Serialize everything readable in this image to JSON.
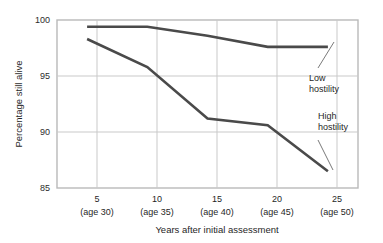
{
  "chart_data": {
    "type": "line",
    "title": "",
    "xlabel": "Years after initial assessment",
    "ylabel": "Percentage still alive",
    "x": [
      5,
      10,
      15,
      20,
      25
    ],
    "categories": [
      "5\n(age 30)",
      "10\n(age 35)",
      "15\n(age 40)",
      "20\n(age 45)",
      "25\n(age 50)"
    ],
    "xtick_labels_top": [
      "5",
      "10",
      "15",
      "20",
      "25"
    ],
    "xtick_labels_bottom": [
      "(age 30)",
      "(age 35)",
      "(age 40)",
      "(age 45)",
      "(age 50)"
    ],
    "ytick_labels": [
      "100",
      "95",
      "90",
      "85"
    ],
    "yticks": [
      100,
      95,
      90,
      85
    ],
    "ylim": [
      85,
      100
    ],
    "xlim": [
      2.5,
      27.5
    ],
    "grid": true,
    "legend_position": "inline-annotation",
    "series": [
      {
        "name": "Low hostility",
        "values": [
          99.4,
          99.4,
          98.6,
          97.6,
          97.6
        ],
        "color": "#4a4a4a"
      },
      {
        "name": "High hostility",
        "values": [
          98.3,
          95.8,
          91.2,
          90.6,
          86.5
        ],
        "color": "#4a4a4a"
      }
    ],
    "annotations": [
      {
        "text_line1": "Low",
        "text_line2": "hostility",
        "target_series": "Low hostility"
      },
      {
        "text_line1": "High",
        "text_line2": "hostility",
        "target_series": "High hostility"
      }
    ],
    "colors": {
      "line": "#4a4a4a",
      "grid": "#c9c9c9",
      "axis": "#b5b5b5",
      "text": "#1f1f1f",
      "background": "#ffffff"
    }
  }
}
